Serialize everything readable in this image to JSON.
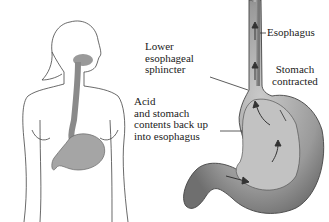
{
  "figure": {
    "left_panel": "Outline of female upper body showing esophagus and stomach",
    "right_panel": "Enlarged stomach and esophagus with reflux arrows"
  },
  "labels": {
    "esophagus": "Esophagus",
    "les": [
      "Lower",
      "esophageal",
      "sphincter"
    ],
    "stomach": [
      "Stomach",
      "contracted"
    ],
    "acid": [
      "Acid",
      "and stomach",
      "contents back up",
      "into esophagus"
    ]
  }
}
